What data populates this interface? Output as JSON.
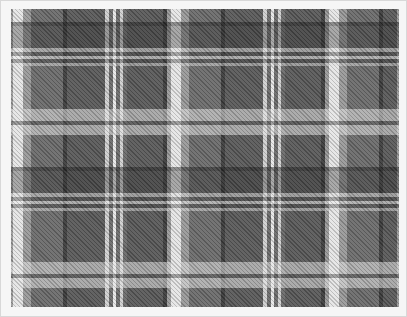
{
  "image": {
    "subject": "grey tartan plaid fabric pattern",
    "colors": {
      "frame": "#f6f6f6",
      "base_grey": "#6e6e6e",
      "dark_grey": "#3e3e3e",
      "mid_grey": "#5a5a5a",
      "light_stripe": "#e6e6e6",
      "accent_stripe": "#d0d0d0"
    },
    "repeat_px": {
      "horizontal": 158,
      "vertical": 153
    }
  }
}
